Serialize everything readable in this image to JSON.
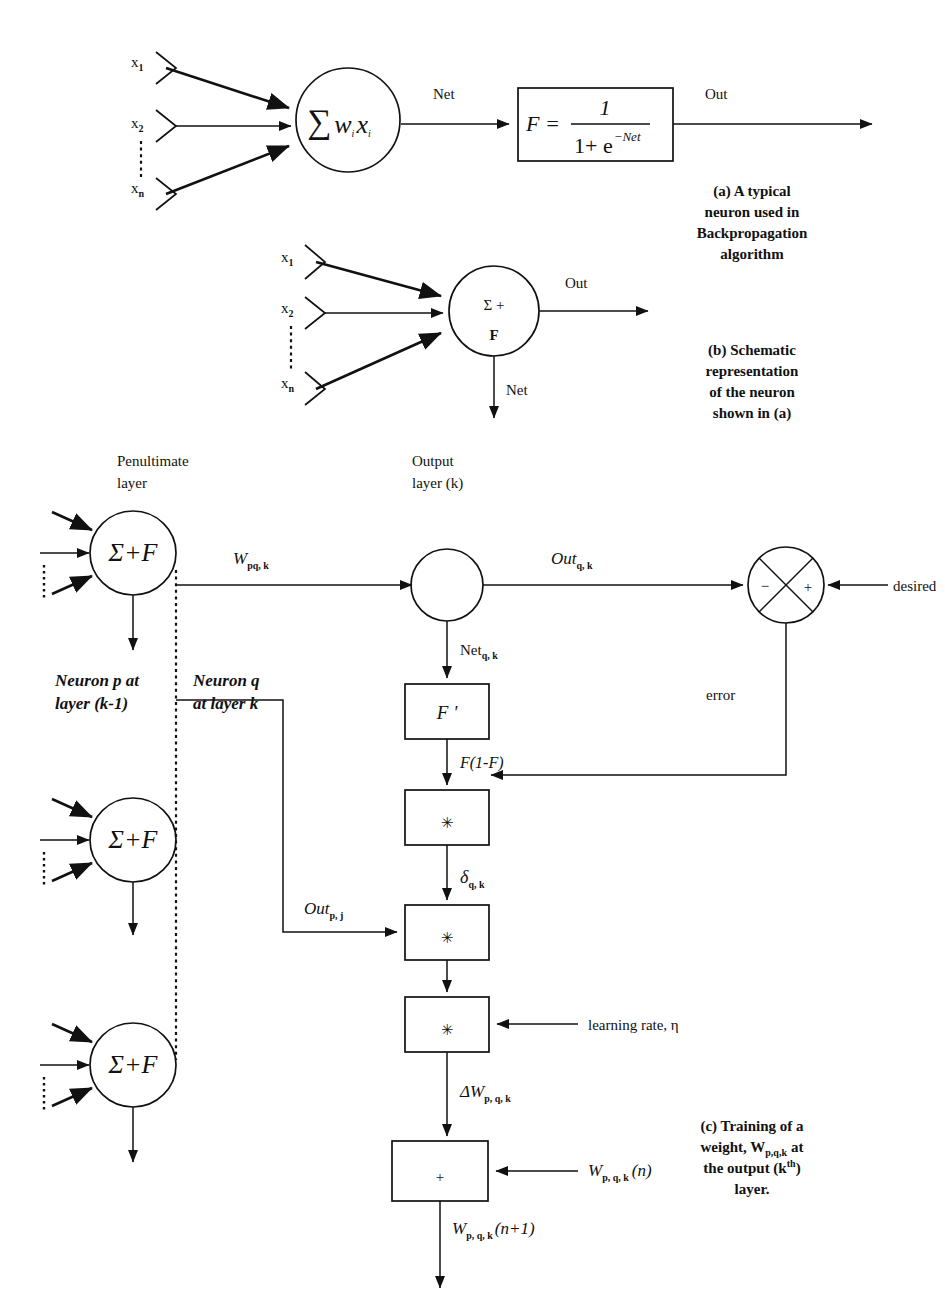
{
  "figure": {
    "background": "#ffffff",
    "ink": "#111111"
  },
  "panel_a": {
    "inputs": [
      "x",
      "x",
      "x"
    ],
    "input_subs": [
      "1",
      "2",
      "n"
    ],
    "vertical_dots": "⋮",
    "neuron_body": "∑",
    "neuron_weight": "w",
    "neuron_weight_sub": "i",
    "neuron_input": "x",
    "neuron_input_sub": "i",
    "net_label": "Net",
    "out_label": "Out",
    "formula_lhs": "F  =",
    "formula_numerator": "1",
    "formula_denominator": "1+ e",
    "formula_exponent": "−Net",
    "caption": [
      "(a) A typical",
      "neuron used in",
      "Backpropagation",
      "algorithm"
    ]
  },
  "panel_b": {
    "inputs": [
      "x",
      "x",
      "x"
    ],
    "input_subs": [
      "1",
      "2",
      "n"
    ],
    "vertical_dots": "⋮",
    "neuron_top": "Σ  +",
    "neuron_bottom": "F",
    "out_label": "Out",
    "net_label": "Net",
    "caption": [
      "(b) Schematic",
      "representation",
      "of the neuron",
      "shown in (a)"
    ]
  },
  "panel_c": {
    "penultimate_layer_label": [
      "Penultimate",
      "layer"
    ],
    "output_layer_label": [
      "Output",
      "layer (k)"
    ],
    "penultimate_neuron_text": "Σ+F",
    "weight_label": "W",
    "weight_sub": "pq, k",
    "out_q_label": "Out",
    "out_q_sub": "q, k",
    "desired_label": "desired",
    "junction_minus": "−",
    "junction_plus": "+",
    "error_label": "error",
    "net_q_label": "Net",
    "net_q_sub": "q, k",
    "fprime_box": "F '",
    "fprime_out_label": "F(1-F)",
    "multiply_glyph": "✳",
    "delta_label": "δ",
    "delta_sub": "q, k",
    "out_p_label": "Out",
    "out_p_sub": "p, j",
    "learning_rate_label": "learning rate,  η",
    "delta_w_label": "ΔW",
    "delta_w_sub": "p, q, k",
    "adder_glyph": "+",
    "w_n_label": "W",
    "w_n_sub": "p, q, k",
    "w_n_arg": "(n)",
    "w_n1_label": "W",
    "w_n1_sub": "p, q, k",
    "w_n1_arg": "(n+1)",
    "neuron_p_label": [
      "Neuron p at",
      "layer (k-1)"
    ],
    "neuron_q_label": [
      "Neuron q",
      "at layer k"
    ],
    "caption": [
      "(c) Training of a",
      "weight, W",
      "at",
      "the output (k",
      ")",
      "layer."
    ],
    "caption_sub_1": "p,q,k",
    "caption_sup_1": "th"
  }
}
